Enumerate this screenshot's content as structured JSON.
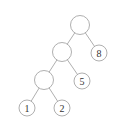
{
  "diagram": {
    "type": "binary-tree",
    "stroke_color": "#9a9a9a",
    "text_color": "#333333",
    "nodes": [
      {
        "id": "root",
        "label": "",
        "x": 80,
        "y": 25
      },
      {
        "id": "n8",
        "label": "8",
        "x": 99,
        "y": 53
      },
      {
        "id": "mid",
        "label": "",
        "x": 62,
        "y": 52
      },
      {
        "id": "n5",
        "label": "5",
        "x": 82,
        "y": 81
      },
      {
        "id": "low",
        "label": "",
        "x": 44,
        "y": 80
      },
      {
        "id": "n1",
        "label": "1",
        "x": 27,
        "y": 108
      },
      {
        "id": "n2",
        "label": "2",
        "x": 62,
        "y": 108
      }
    ],
    "edges": [
      [
        "root",
        "mid"
      ],
      [
        "root",
        "n8"
      ],
      [
        "mid",
        "low"
      ],
      [
        "mid",
        "n5"
      ],
      [
        "low",
        "n1"
      ],
      [
        "low",
        "n2"
      ]
    ]
  }
}
